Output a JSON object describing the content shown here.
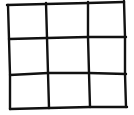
{
  "game": {
    "type": "tic-tac-toe",
    "rows": 3,
    "cols": 3,
    "cells": [
      "",
      "",
      "",
      "",
      "",
      "",
      "",
      "",
      ""
    ]
  },
  "colors": {
    "background": "#ffffff",
    "ink": "#111111"
  }
}
